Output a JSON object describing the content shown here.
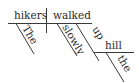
{
  "diagram": {
    "type": "sentence-diagram",
    "subject": "hikers",
    "verb": "walked",
    "modifiers": {
      "subject_article": "The",
      "verb_adverb": "slowly",
      "preposition": "up",
      "prep_object": "hill",
      "object_article": "the"
    }
  }
}
